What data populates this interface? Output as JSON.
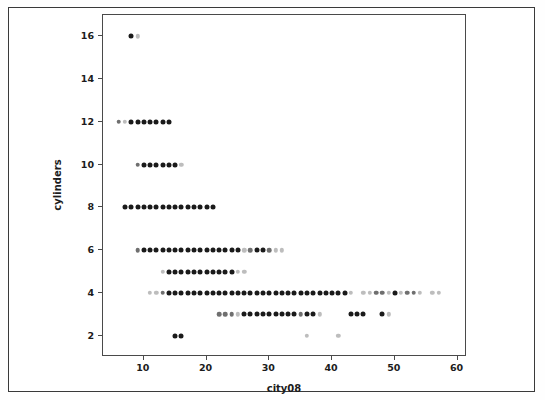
{
  "figure": {
    "xlabel": "city08",
    "ylabel": "cylinders"
  },
  "axis": {
    "x_ticks": [
      "10",
      "20",
      "30",
      "40",
      "50",
      "60"
    ],
    "y_ticks": [
      "2",
      "4",
      "6",
      "8",
      "10",
      "12",
      "14",
      "16"
    ]
  },
  "colors": {
    "frame": "#4a4a4a",
    "page_border": "#3a3a3a",
    "point_dark": "#1a1a1a",
    "point_mid": "#6f6f6f",
    "point_light": "#bdbdbd",
    "background": "#ffffff",
    "text": "#1c1c1c"
  },
  "chart_data": {
    "type": "scatter",
    "title": "",
    "xlabel": "city08",
    "ylabel": "cylinders",
    "xlim": [
      3.5,
      61.5
    ],
    "ylim": [
      1.0,
      17.0
    ],
    "xticks": [
      10,
      20,
      30,
      40,
      50,
      60
    ],
    "yticks": [
      2,
      4,
      6,
      8,
      10,
      12,
      14,
      16
    ],
    "grid": false,
    "legend": null,
    "note": "Each marker is one (city08 MPG, cylinders) combination; marker darkness encodes how many vehicles share that combination (dark = many, light = few).",
    "series": [
      {
        "name": "vehicles",
        "points": [
          {
            "x": 8,
            "y": 16,
            "shade": "dark"
          },
          {
            "x": 9,
            "y": 16,
            "shade": "light"
          },
          {
            "x": 6,
            "y": 12,
            "shade": "mid"
          },
          {
            "x": 7,
            "y": 12,
            "shade": "light"
          },
          {
            "x": 8,
            "y": 12,
            "shade": "dark"
          },
          {
            "x": 9,
            "y": 12,
            "shade": "dark"
          },
          {
            "x": 10,
            "y": 12,
            "shade": "dark"
          },
          {
            "x": 11,
            "y": 12,
            "shade": "dark"
          },
          {
            "x": 12,
            "y": 12,
            "shade": "dark"
          },
          {
            "x": 13,
            "y": 12,
            "shade": "dark"
          },
          {
            "x": 14,
            "y": 12,
            "shade": "dark"
          },
          {
            "x": 9,
            "y": 10,
            "shade": "mid"
          },
          {
            "x": 10,
            "y": 10,
            "shade": "dark"
          },
          {
            "x": 11,
            "y": 10,
            "shade": "dark"
          },
          {
            "x": 12,
            "y": 10,
            "shade": "dark"
          },
          {
            "x": 13,
            "y": 10,
            "shade": "dark"
          },
          {
            "x": 14,
            "y": 10,
            "shade": "dark"
          },
          {
            "x": 15,
            "y": 10,
            "shade": "dark"
          },
          {
            "x": 16,
            "y": 10,
            "shade": "light"
          },
          {
            "x": 7,
            "y": 8,
            "shade": "dark"
          },
          {
            "x": 8,
            "y": 8,
            "shade": "dark"
          },
          {
            "x": 9,
            "y": 8,
            "shade": "dark"
          },
          {
            "x": 10,
            "y": 8,
            "shade": "dark"
          },
          {
            "x": 11,
            "y": 8,
            "shade": "dark"
          },
          {
            "x": 12,
            "y": 8,
            "shade": "dark"
          },
          {
            "x": 13,
            "y": 8,
            "shade": "dark"
          },
          {
            "x": 14,
            "y": 8,
            "shade": "dark"
          },
          {
            "x": 15,
            "y": 8,
            "shade": "dark"
          },
          {
            "x": 16,
            "y": 8,
            "shade": "dark"
          },
          {
            "x": 17,
            "y": 8,
            "shade": "dark"
          },
          {
            "x": 18,
            "y": 8,
            "shade": "dark"
          },
          {
            "x": 19,
            "y": 8,
            "shade": "dark"
          },
          {
            "x": 20,
            "y": 8,
            "shade": "dark"
          },
          {
            "x": 21,
            "y": 8,
            "shade": "dark"
          },
          {
            "x": 9,
            "y": 6,
            "shade": "mid"
          },
          {
            "x": 10,
            "y": 6,
            "shade": "dark"
          },
          {
            "x": 11,
            "y": 6,
            "shade": "dark"
          },
          {
            "x": 12,
            "y": 6,
            "shade": "dark"
          },
          {
            "x": 13,
            "y": 6,
            "shade": "dark"
          },
          {
            "x": 14,
            "y": 6,
            "shade": "dark"
          },
          {
            "x": 15,
            "y": 6,
            "shade": "dark"
          },
          {
            "x": 16,
            "y": 6,
            "shade": "dark"
          },
          {
            "x": 17,
            "y": 6,
            "shade": "dark"
          },
          {
            "x": 18,
            "y": 6,
            "shade": "dark"
          },
          {
            "x": 19,
            "y": 6,
            "shade": "dark"
          },
          {
            "x": 20,
            "y": 6,
            "shade": "dark"
          },
          {
            "x": 21,
            "y": 6,
            "shade": "dark"
          },
          {
            "x": 22,
            "y": 6,
            "shade": "dark"
          },
          {
            "x": 23,
            "y": 6,
            "shade": "dark"
          },
          {
            "x": 24,
            "y": 6,
            "shade": "dark"
          },
          {
            "x": 25,
            "y": 6,
            "shade": "dark"
          },
          {
            "x": 26,
            "y": 6,
            "shade": "light"
          },
          {
            "x": 27,
            "y": 6,
            "shade": "mid"
          },
          {
            "x": 28,
            "y": 6,
            "shade": "dark"
          },
          {
            "x": 29,
            "y": 6,
            "shade": "dark"
          },
          {
            "x": 30,
            "y": 6,
            "shade": "mid"
          },
          {
            "x": 31,
            "y": 6,
            "shade": "light"
          },
          {
            "x": 32,
            "y": 6,
            "shade": "light"
          },
          {
            "x": 13,
            "y": 5,
            "shade": "light"
          },
          {
            "x": 14,
            "y": 5,
            "shade": "dark"
          },
          {
            "x": 15,
            "y": 5,
            "shade": "dark"
          },
          {
            "x": 16,
            "y": 5,
            "shade": "dark"
          },
          {
            "x": 17,
            "y": 5,
            "shade": "dark"
          },
          {
            "x": 18,
            "y": 5,
            "shade": "dark"
          },
          {
            "x": 19,
            "y": 5,
            "shade": "dark"
          },
          {
            "x": 20,
            "y": 5,
            "shade": "dark"
          },
          {
            "x": 21,
            "y": 5,
            "shade": "dark"
          },
          {
            "x": 22,
            "y": 5,
            "shade": "dark"
          },
          {
            "x": 23,
            "y": 5,
            "shade": "dark"
          },
          {
            "x": 24,
            "y": 5,
            "shade": "dark"
          },
          {
            "x": 25,
            "y": 5,
            "shade": "light"
          },
          {
            "x": 26,
            "y": 5,
            "shade": "light"
          },
          {
            "x": 11,
            "y": 4,
            "shade": "light"
          },
          {
            "x": 12,
            "y": 4,
            "shade": "light"
          },
          {
            "x": 13,
            "y": 4,
            "shade": "mid"
          },
          {
            "x": 14,
            "y": 4,
            "shade": "dark"
          },
          {
            "x": 15,
            "y": 4,
            "shade": "dark"
          },
          {
            "x": 16,
            "y": 4,
            "shade": "dark"
          },
          {
            "x": 17,
            "y": 4,
            "shade": "dark"
          },
          {
            "x": 18,
            "y": 4,
            "shade": "dark"
          },
          {
            "x": 19,
            "y": 4,
            "shade": "dark"
          },
          {
            "x": 20,
            "y": 4,
            "shade": "dark"
          },
          {
            "x": 21,
            "y": 4,
            "shade": "dark"
          },
          {
            "x": 22,
            "y": 4,
            "shade": "dark"
          },
          {
            "x": 23,
            "y": 4,
            "shade": "dark"
          },
          {
            "x": 24,
            "y": 4,
            "shade": "dark"
          },
          {
            "x": 25,
            "y": 4,
            "shade": "dark"
          },
          {
            "x": 26,
            "y": 4,
            "shade": "dark"
          },
          {
            "x": 27,
            "y": 4,
            "shade": "dark"
          },
          {
            "x": 28,
            "y": 4,
            "shade": "dark"
          },
          {
            "x": 29,
            "y": 4,
            "shade": "dark"
          },
          {
            "x": 30,
            "y": 4,
            "shade": "dark"
          },
          {
            "x": 31,
            "y": 4,
            "shade": "dark"
          },
          {
            "x": 32,
            "y": 4,
            "shade": "dark"
          },
          {
            "x": 33,
            "y": 4,
            "shade": "dark"
          },
          {
            "x": 34,
            "y": 4,
            "shade": "dark"
          },
          {
            "x": 35,
            "y": 4,
            "shade": "dark"
          },
          {
            "x": 36,
            "y": 4,
            "shade": "dark"
          },
          {
            "x": 37,
            "y": 4,
            "shade": "dark"
          },
          {
            "x": 38,
            "y": 4,
            "shade": "dark"
          },
          {
            "x": 39,
            "y": 4,
            "shade": "dark"
          },
          {
            "x": 40,
            "y": 4,
            "shade": "dark"
          },
          {
            "x": 41,
            "y": 4,
            "shade": "dark"
          },
          {
            "x": 42,
            "y": 4,
            "shade": "dark"
          },
          {
            "x": 43,
            "y": 4,
            "shade": "light"
          },
          {
            "x": 45,
            "y": 4,
            "shade": "light"
          },
          {
            "x": 46,
            "y": 4,
            "shade": "light"
          },
          {
            "x": 47,
            "y": 4,
            "shade": "mid"
          },
          {
            "x": 48,
            "y": 4,
            "shade": "mid"
          },
          {
            "x": 49,
            "y": 4,
            "shade": "light"
          },
          {
            "x": 50,
            "y": 4,
            "shade": "dark"
          },
          {
            "x": 51,
            "y": 4,
            "shade": "light"
          },
          {
            "x": 52,
            "y": 4,
            "shade": "mid"
          },
          {
            "x": 53,
            "y": 4,
            "shade": "mid"
          },
          {
            "x": 54,
            "y": 4,
            "shade": "light"
          },
          {
            "x": 56,
            "y": 4,
            "shade": "light"
          },
          {
            "x": 57,
            "y": 4,
            "shade": "light"
          },
          {
            "x": 22,
            "y": 3,
            "shade": "mid"
          },
          {
            "x": 23,
            "y": 3,
            "shade": "mid"
          },
          {
            "x": 24,
            "y": 3,
            "shade": "mid"
          },
          {
            "x": 25,
            "y": 3,
            "shade": "light"
          },
          {
            "x": 26,
            "y": 3,
            "shade": "dark"
          },
          {
            "x": 27,
            "y": 3,
            "shade": "dark"
          },
          {
            "x": 28,
            "y": 3,
            "shade": "dark"
          },
          {
            "x": 29,
            "y": 3,
            "shade": "dark"
          },
          {
            "x": 30,
            "y": 3,
            "shade": "dark"
          },
          {
            "x": 31,
            "y": 3,
            "shade": "dark"
          },
          {
            "x": 32,
            "y": 3,
            "shade": "dark"
          },
          {
            "x": 33,
            "y": 3,
            "shade": "dark"
          },
          {
            "x": 34,
            "y": 3,
            "shade": "dark"
          },
          {
            "x": 35,
            "y": 3,
            "shade": "mid"
          },
          {
            "x": 36,
            "y": 3,
            "shade": "dark"
          },
          {
            "x": 37,
            "y": 3,
            "shade": "dark"
          },
          {
            "x": 38,
            "y": 3,
            "shade": "light"
          },
          {
            "x": 43,
            "y": 3,
            "shade": "dark"
          },
          {
            "x": 44,
            "y": 3,
            "shade": "dark"
          },
          {
            "x": 45,
            "y": 3,
            "shade": "dark"
          },
          {
            "x": 48,
            "y": 3,
            "shade": "dark"
          },
          {
            "x": 49,
            "y": 3,
            "shade": "light"
          },
          {
            "x": 15,
            "y": 2,
            "shade": "dark"
          },
          {
            "x": 16,
            "y": 2,
            "shade": "dark"
          },
          {
            "x": 36,
            "y": 2,
            "shade": "light"
          },
          {
            "x": 41,
            "y": 2,
            "shade": "light"
          }
        ]
      }
    ]
  }
}
